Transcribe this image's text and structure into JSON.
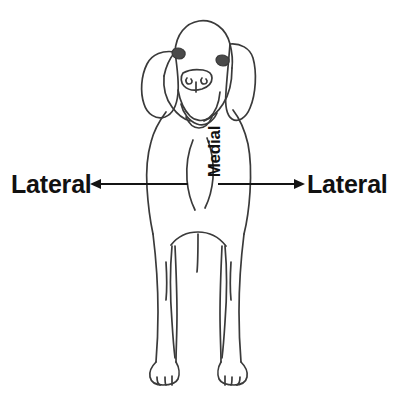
{
  "figure": {
    "background_color": "#ffffff",
    "line_color": "#3a3a3a",
    "text_color": "#111111",
    "width": 395,
    "height": 394
  },
  "labels": {
    "lateral_left": "Lateral",
    "lateral_right": "Lateral",
    "medial": "Medial"
  },
  "arrows": {
    "left": {
      "direction": "left",
      "from_x": 188,
      "to_x": 90,
      "y": 184
    },
    "right": {
      "direction": "right",
      "from_x": 218,
      "to_x": 305,
      "y": 184
    }
  },
  "illustration": {
    "subject": "dog",
    "view": "front",
    "style": "line-art outline drawing",
    "parts": [
      "head",
      "left-ear",
      "right-ear",
      "left-eye",
      "right-eye",
      "muzzle",
      "nose",
      "chest",
      "body",
      "left-front-leg",
      "right-front-leg",
      "left-paw",
      "right-paw",
      "hind-legs"
    ]
  }
}
